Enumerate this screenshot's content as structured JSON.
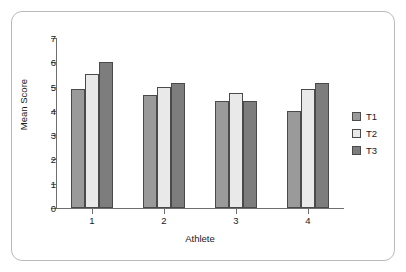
{
  "chart_data": {
    "type": "bar",
    "title": "",
    "xlabel": "Athlete",
    "ylabel": "Mean Score",
    "categories": [
      "1",
      "2",
      "3",
      "4"
    ],
    "series": [
      {
        "name": "T1",
        "values": [
          4.9,
          4.65,
          4.4,
          4.0
        ],
        "color": "#9a9a9a"
      },
      {
        "name": "T2",
        "values": [
          5.5,
          5.0,
          4.75,
          4.9
        ],
        "color": "#e9e9e9"
      },
      {
        "name": "T3",
        "values": [
          6.0,
          5.15,
          4.4,
          5.15
        ],
        "color": "#7d7d7d"
      }
    ],
    "ylim": [
      0,
      7
    ],
    "yticks": [
      0,
      1,
      2,
      3,
      4,
      5,
      6,
      7
    ],
    "ytick_labels": [
      "0",
      "1",
      "2",
      "3",
      "4",
      "5",
      "6",
      "7"
    ],
    "grid": false,
    "legend_position": "right",
    "bar_outline_color": "#4a4a4a",
    "axis_color": "#6e6e6e",
    "frame_color": "#b9b9b9",
    "background": "#ffffff"
  }
}
